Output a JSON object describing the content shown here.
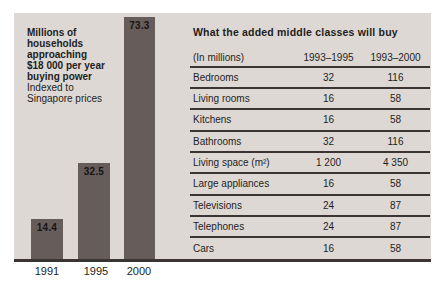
{
  "colors": {
    "page_bg": "#ffffff",
    "panel_bg": "#ded8d4",
    "bar_fill": "#665d5b",
    "rule": "#3a3432",
    "text": "#221e1d"
  },
  "chart_data": [
    {
      "type": "bar",
      "title": "Millions of households approaching $18 000 per year buying power",
      "subtitle": "Indexed to Singapore prices",
      "title_lines_bold": [
        "Millions of",
        "households",
        "approaching",
        "$18 000 per year",
        "buying power"
      ],
      "subtitle_lines": [
        "Indexed to",
        "Singapore prices"
      ],
      "categories": [
        "1991",
        "1995",
        "2000"
      ],
      "values": [
        14.4,
        32.5,
        73.3
      ],
      "value_label_position": "inside-top",
      "ylim": [
        0,
        75
      ],
      "grid": false,
      "legend": false
    },
    {
      "type": "table",
      "title": "What the added middle classes will buy",
      "columns": [
        "(In millions)",
        "1993–1995",
        "1993–2000"
      ],
      "rows": [
        [
          "Bedrooms",
          "32",
          "116"
        ],
        [
          "Living rooms",
          "16",
          "58"
        ],
        [
          "Kitchens",
          "16",
          "58"
        ],
        [
          "Bathrooms",
          "32",
          "116"
        ],
        [
          "Living space (m²)",
          "1 200",
          "4 350"
        ],
        [
          "Large appliances",
          "16",
          "58"
        ],
        [
          "Televisions",
          "24",
          "87"
        ],
        [
          "Telephones",
          "24",
          "87"
        ],
        [
          "Cars",
          "16",
          "58"
        ]
      ]
    }
  ]
}
